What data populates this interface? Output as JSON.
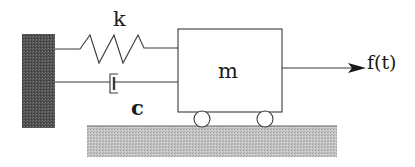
{
  "diagram": {
    "labels": {
      "spring": "k",
      "damper": "c",
      "mass": "m",
      "force": "f(t)"
    },
    "components": [
      {
        "id": "wall",
        "type": "fixed-support"
      },
      {
        "id": "spring",
        "type": "spring",
        "label": "k",
        "connects": [
          "wall",
          "mass"
        ]
      },
      {
        "id": "damper",
        "type": "dashpot",
        "label": "c",
        "connects": [
          "wall",
          "mass"
        ]
      },
      {
        "id": "mass",
        "type": "block",
        "label": "m"
      },
      {
        "id": "wheels",
        "type": "rollers",
        "count": 2
      },
      {
        "id": "ground",
        "type": "ground"
      },
      {
        "id": "force",
        "type": "arrow",
        "label": "f(t)",
        "direction": "right"
      }
    ],
    "colors": {
      "line": "#3a3a3a",
      "wall": "#5a5a5a",
      "ground": "#bdbdbd",
      "text": "#1a1a1a"
    }
  }
}
